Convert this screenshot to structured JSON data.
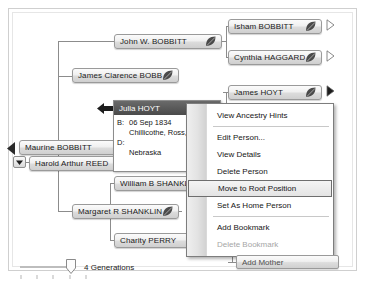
{
  "app": {
    "title": "Family Tree Pedigree View"
  },
  "nodes": [
    {
      "id": "isham",
      "name": "Isham BOBBITT",
      "leaf": true,
      "x": 228,
      "y": 19,
      "w": 94,
      "arrow": "hollow",
      "ax": 326,
      "ay": 19
    },
    {
      "id": "cynthia",
      "name": "Cynthia HAGGARD",
      "leaf": true,
      "x": 228,
      "y": 50,
      "w": 94,
      "arrow": "hollow",
      "ax": 326,
      "ay": 50
    },
    {
      "id": "johnw",
      "name": "John W. BOBBITT",
      "leaf": true,
      "x": 114,
      "y": 34,
      "w": 108,
      "arrow": "none",
      "ax": 0,
      "ay": 0
    },
    {
      "id": "jamesc",
      "name": "James Clarence BOBBITT",
      "leaf": true,
      "x": 72,
      "y": 68,
      "w": 107,
      "arrow": "none",
      "ax": 0,
      "ay": 0
    },
    {
      "id": "jameshoyt",
      "name": "James HOYT",
      "leaf": true,
      "x": 228,
      "y": 85,
      "w": 94,
      "arrow": "solid",
      "ax": 326,
      "ay": 85
    },
    {
      "id": "blank1",
      "name": "",
      "leaf": false,
      "x": 280,
      "y": 116,
      "w": 42,
      "arrow": "solid",
      "ax": 326,
      "ay": 116
    },
    {
      "id": "blank2",
      "name": "",
      "leaf": true,
      "x": 280,
      "y": 147,
      "w": 42,
      "arrow": "hollow",
      "ax": 326,
      "ay": 147
    },
    {
      "id": "blank3",
      "name": "",
      "leaf": false,
      "x": 280,
      "y": 178,
      "w": 42,
      "arrow": "hollow",
      "ax": 326,
      "ay": 178
    },
    {
      "id": "blank4",
      "name": "",
      "leaf": false,
      "x": 280,
      "y": 213,
      "w": 42,
      "arrow": "none",
      "ax": 0,
      "ay": 0
    },
    {
      "id": "maurine",
      "name": "Maurine BOBBITT",
      "leaf": false,
      "x": 19,
      "y": 140,
      "w": 101,
      "arrow": "none",
      "ax": 0,
      "ay": 0
    },
    {
      "id": "harold",
      "name": "Harold Arthur REED",
      "leaf": false,
      "x": 29,
      "y": 156,
      "w": 92,
      "arrow": "none",
      "ax": 0,
      "ay": 0
    },
    {
      "id": "williamb",
      "name": "William B SHANKLIN",
      "leaf": false,
      "x": 114,
      "y": 176,
      "w": 86,
      "arrow": "none",
      "ax": 0,
      "ay": 0
    },
    {
      "id": "margaret",
      "name": "Margaret R SHANKLIN",
      "leaf": true,
      "x": 72,
      "y": 204,
      "w": 107,
      "arrow": "none",
      "ax": 0,
      "ay": 0
    },
    {
      "id": "charity",
      "name": "Charity PERRY",
      "leaf": false,
      "x": 114,
      "y": 233,
      "w": 86,
      "arrow": "none",
      "ax": 0,
      "ay": 0
    }
  ],
  "selected_person": {
    "name": "Julia HOYT",
    "birth_label": "B:",
    "birth_date": "06 Sep 1834",
    "birth_place": "Chillicothe, Ross,",
    "death_label": "D:",
    "death_place": "Nebraska"
  },
  "context_menu": {
    "items": [
      {
        "label": "View Ancestry Hints",
        "state": "normal",
        "separator_after": true
      },
      {
        "label": "Edit Person...",
        "state": "normal",
        "separator_after": false
      },
      {
        "label": "View Details",
        "state": "normal",
        "separator_after": false
      },
      {
        "label": "Delete Person",
        "state": "normal",
        "separator_after": false
      },
      {
        "label": "Move to Root Position",
        "state": "selected",
        "separator_after": false
      },
      {
        "label": "Set As Home Person",
        "state": "normal",
        "separator_after": true
      },
      {
        "label": "Add Bookmark",
        "state": "normal",
        "separator_after": false
      },
      {
        "label": "Delete Bookmark",
        "state": "disabled",
        "separator_after": false
      }
    ]
  },
  "generations_slider": {
    "label": "4 Generations",
    "value": 4
  },
  "add_mother_button": {
    "label": "Add Mother"
  },
  "icons": {
    "leaf": "leaf-icon",
    "back_arrow": "back-arrow-icon",
    "dropdown": "chevron-down-icon",
    "selection_pointer": "selection-pointer-icon"
  },
  "colors": {
    "node_border": "#9a9a9a",
    "selected_header": "#4a4a4a",
    "menu_border": "#7d7d7d",
    "highlight_border": "#6e6e6e"
  }
}
